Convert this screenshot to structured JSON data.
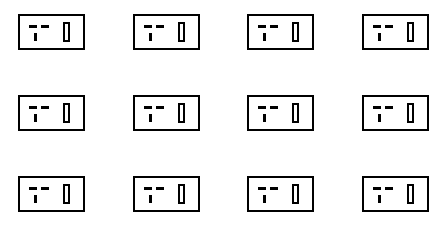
{
  "canvas": {
    "width": 445,
    "height": 231,
    "background_color": "#ffffff"
  },
  "diagram": {
    "icon_semantic": "electrical-outlet-icon",
    "stroke_color": "#000000",
    "fill_color": "#ffffff",
    "stroke_width": 2,
    "grid": {
      "columns": 4,
      "rows": 3,
      "total_items": 12,
      "column_x": [
        18,
        133,
        247,
        362
      ],
      "row_y": [
        14,
        95,
        176
      ],
      "cell_width": 67,
      "cell_height": 36
    },
    "icon_parts": [
      {
        "name": "outer-rectangle",
        "shape": "rectangle",
        "filled": false
      },
      {
        "name": "left-slot-bar",
        "shape": "horizontal-bar",
        "filled": true
      },
      {
        "name": "right-slot-bar",
        "shape": "horizontal-bar",
        "filled": true
      },
      {
        "name": "ground-pin-bar",
        "shape": "vertical-bar",
        "filled": true
      },
      {
        "name": "tall-slot-rectangle",
        "shape": "vertical-rectangle",
        "filled": false
      }
    ],
    "items": [
      {
        "id": "item-1",
        "row": 0,
        "col": 0
      },
      {
        "id": "item-2",
        "row": 0,
        "col": 1
      },
      {
        "id": "item-3",
        "row": 0,
        "col": 2
      },
      {
        "id": "item-4",
        "row": 0,
        "col": 3
      },
      {
        "id": "item-5",
        "row": 1,
        "col": 0
      },
      {
        "id": "item-6",
        "row": 1,
        "col": 1
      },
      {
        "id": "item-7",
        "row": 1,
        "col": 2
      },
      {
        "id": "item-8",
        "row": 1,
        "col": 3
      },
      {
        "id": "item-9",
        "row": 2,
        "col": 0
      },
      {
        "id": "item-10",
        "row": 2,
        "col": 1
      },
      {
        "id": "item-11",
        "row": 2,
        "col": 2
      },
      {
        "id": "item-12",
        "row": 2,
        "col": 3
      }
    ]
  }
}
